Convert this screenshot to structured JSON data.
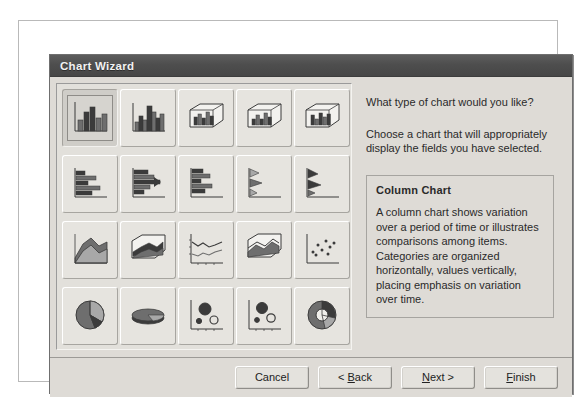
{
  "window": {
    "title": "Chart Wizard"
  },
  "prompt": {
    "question": "What type of chart would you like?",
    "help": "Choose a chart that will appropriately display the fields you have selected."
  },
  "description": {
    "title": "Column Chart",
    "text": "A column chart shows variation over a period of time or illustrates comparisons among items. Categories are organized horizontally, values vertically, placing emphasis on variation over time."
  },
  "gallery": {
    "selected_index": 0,
    "items": [
      {
        "name": "column-chart",
        "label": "Column Chart",
        "icon": "column"
      },
      {
        "name": "column-chart-3d",
        "label": "3-D Column Chart",
        "icon": "column3d"
      },
      {
        "name": "column-chart-3d-perspective",
        "label": "3-D Perspective Column Chart",
        "icon": "box-column"
      },
      {
        "name": "column-chart-3d-stacked",
        "label": "3-D Stacked Column Chart",
        "icon": "box-column-2"
      },
      {
        "name": "column-chart-3d-clustered",
        "label": "3-D Clustered Column Chart",
        "icon": "box-column-3"
      },
      {
        "name": "bar-chart",
        "label": "Bar Chart",
        "icon": "bar"
      },
      {
        "name": "bar-chart-stacked",
        "label": "Stacked Bar Chart",
        "icon": "bar-stacked"
      },
      {
        "name": "bar-chart-clustered",
        "label": "Clustered Bar Chart",
        "icon": "bar-clustered"
      },
      {
        "name": "bar-chart-3d",
        "label": "3-D Bar Chart",
        "icon": "bar-3d"
      },
      {
        "name": "bar-chart-cone",
        "label": "Cone Bar Chart",
        "icon": "bar-cone"
      },
      {
        "name": "area-chart",
        "label": "Area Chart",
        "icon": "area"
      },
      {
        "name": "area-chart-3d",
        "label": "3-D Area Chart",
        "icon": "area3d"
      },
      {
        "name": "line-chart",
        "label": "Line Chart",
        "icon": "line"
      },
      {
        "name": "area-chart-3d-perspective",
        "label": "3-D Perspective Area Chart",
        "icon": "box-area"
      },
      {
        "name": "scatter-chart",
        "label": "XY Scatter Chart",
        "icon": "scatter"
      },
      {
        "name": "pie-chart",
        "label": "Pie Chart",
        "icon": "pie"
      },
      {
        "name": "pie-chart-3d",
        "label": "3-D Pie Chart",
        "icon": "pie3d"
      },
      {
        "name": "bubble-chart",
        "label": "Bubble Chart",
        "icon": "bubble"
      },
      {
        "name": "bubble-chart-2",
        "label": "Bubble Chart Variant",
        "icon": "bubble2"
      },
      {
        "name": "doughnut-chart",
        "label": "Doughnut Chart",
        "icon": "doughnut"
      }
    ]
  },
  "footer": {
    "cancel_label": "Cancel",
    "back_label": "< Back",
    "back_prefix": "< ",
    "back_accel": "B",
    "back_suffix": "ack",
    "next_prefix": "",
    "next_accel": "N",
    "next_suffix": "ext >",
    "next_label": "Next >",
    "finish_accel": "F",
    "finish_suffix": "inish",
    "finish_label": "Finish"
  },
  "colors": {
    "titlebar": "#4e4e4e",
    "dialog_face": "#dedbd6",
    "panel_face": "#e2e0db",
    "ink_dark": "#3b3b3b",
    "ink_mid": "#6e6e6e",
    "ink_light": "#a8a8a8"
  }
}
